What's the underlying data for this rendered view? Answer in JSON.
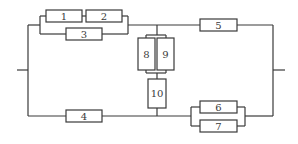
{
  "diagram": {
    "type": "reliability-block-diagram",
    "blocks": [
      {
        "id": "1",
        "label": "1"
      },
      {
        "id": "2",
        "label": "2"
      },
      {
        "id": "3",
        "label": "3"
      },
      {
        "id": "4",
        "label": "4"
      },
      {
        "id": "5",
        "label": "5"
      },
      {
        "id": "6",
        "label": "6"
      },
      {
        "id": "7",
        "label": "7"
      },
      {
        "id": "8",
        "label": "8"
      },
      {
        "id": "9",
        "label": "9"
      },
      {
        "id": "10",
        "label": "10"
      }
    ],
    "structure": {
      "left_terminal": "input",
      "right_terminal": "output",
      "upper_path": "((1 series 2) parallel 3) series 5",
      "lower_path": "4 series (6 parallel 7)",
      "bridge": "(8 parallel 9) series 10 between upper and lower paths"
    }
  }
}
